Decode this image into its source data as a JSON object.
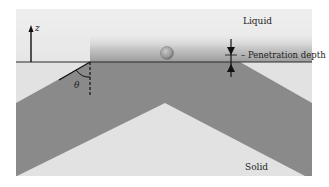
{
  "diagram": {
    "labels": {
      "liquid": "Liquid",
      "solid": "Solid",
      "penetration_depth": "– Penetration depth",
      "z_axis": "z",
      "angle": "θ"
    },
    "colors": {
      "background": "#ffffff",
      "liquid": "#ececec",
      "solid_light": "#e2e2e2",
      "solid_dark": "#8a8a8a",
      "surface_line": "#2a2a2a",
      "particle": "#9a9a9a"
    },
    "elements": [
      "z-axis arrow",
      "liquid region",
      "solid surface line",
      "penetration gradient band",
      "spherical particle",
      "contact angle theta",
      "penetration depth arrows",
      "V-shaped dark solid band"
    ]
  }
}
